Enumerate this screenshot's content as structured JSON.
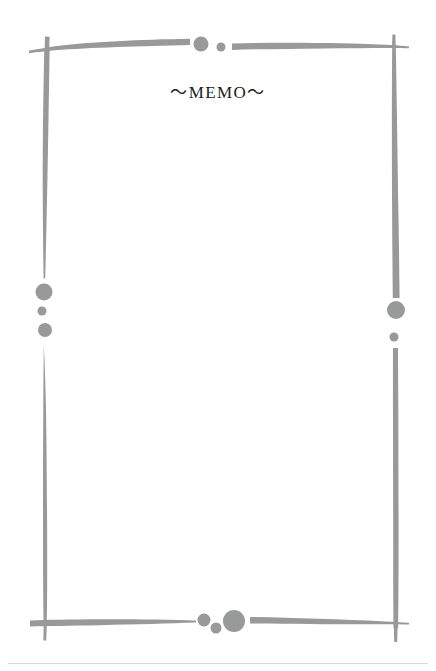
{
  "page": {
    "title": "～MEMO～",
    "background_color": "#ffffff",
    "width": 436,
    "height": 671
  },
  "frame": {
    "stroke_color": "#989a99",
    "style": "hand-drawn-brush-stroke-rectangle",
    "strokes": [
      {
        "name": "top-left-horizontal",
        "orientation": "horizontal"
      },
      {
        "name": "top-right-horizontal",
        "orientation": "horizontal"
      },
      {
        "name": "left-upper-vertical",
        "orientation": "vertical"
      },
      {
        "name": "left-lower-vertical",
        "orientation": "vertical"
      },
      {
        "name": "right-upper-vertical",
        "orientation": "vertical"
      },
      {
        "name": "right-lower-vertical",
        "orientation": "vertical"
      },
      {
        "name": "bottom-left-horizontal",
        "orientation": "horizontal"
      },
      {
        "name": "bottom-right-horizontal",
        "orientation": "horizontal"
      }
    ],
    "dots": [
      {
        "name": "top-center-large-dot",
        "cx": 201,
        "cy": 44,
        "r": 7.5
      },
      {
        "name": "top-center-small-dot",
        "cx": 221,
        "cy": 47,
        "r": 4.5
      },
      {
        "name": "left-middle-large-dot",
        "cx": 44,
        "cy": 292,
        "r": 8.5
      },
      {
        "name": "left-middle-small-dot",
        "cx": 42,
        "cy": 311,
        "r": 4.5
      },
      {
        "name": "left-middle-medium-dot",
        "cx": 45,
        "cy": 330,
        "r": 7
      },
      {
        "name": "right-middle-large-dot",
        "cx": 396,
        "cy": 310,
        "r": 9
      },
      {
        "name": "right-middle-small-dot",
        "cx": 394,
        "cy": 337,
        "r": 4.5
      },
      {
        "name": "bottom-center-medium-dot",
        "cx": 204,
        "cy": 620,
        "r": 6.5
      },
      {
        "name": "bottom-center-small-dot",
        "cx": 216,
        "cy": 628,
        "r": 5.5
      },
      {
        "name": "bottom-center-large-dot",
        "cx": 234,
        "cy": 621,
        "r": 11
      }
    ]
  },
  "footer": {
    "rule_color": "#d8d9da"
  }
}
